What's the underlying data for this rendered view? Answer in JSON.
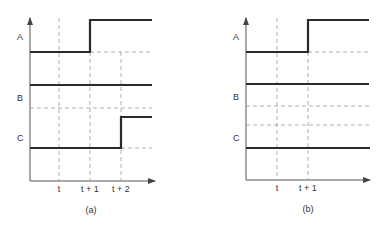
{
  "diagrams": [
    {
      "id": "a",
      "caption": "(a)",
      "signals": [
        {
          "name": "A",
          "description": "low until t+1, then high"
        },
        {
          "name": "B",
          "description": "constant high level"
        },
        {
          "name": "C",
          "description": "low until t+2, then high"
        }
      ],
      "time_ticks": [
        "t",
        "t + 1",
        "t + 2"
      ]
    },
    {
      "id": "b",
      "caption": "(b)",
      "signals": [
        {
          "name": "A",
          "description": "low until t+1, then high"
        },
        {
          "name": "B",
          "description": "constant level"
        },
        {
          "name": "C",
          "description": "constant level"
        }
      ],
      "time_ticks": [
        "t",
        "t + 1"
      ]
    }
  ]
}
